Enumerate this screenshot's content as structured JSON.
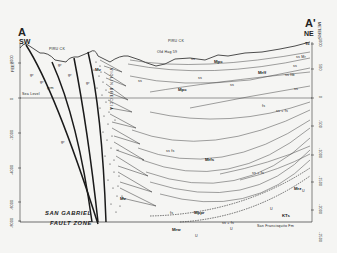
{
  "diagram": {
    "type": "geologic-cross-section",
    "endpoints": {
      "left": {
        "label": "A",
        "direction": "SW"
      },
      "right": {
        "label": "A'",
        "direction": "NE"
      }
    },
    "left_axis": {
      "unit": "FEET",
      "ticks": [
        "2000",
        "0",
        "-2000",
        "-4000",
        "-6000",
        "-8000"
      ]
    },
    "right_axis": {
      "unit": "METERS",
      "ticks": [
        "1000",
        "500",
        "0",
        "-500",
        "-1000",
        "-1500",
        "-2000",
        "-2500"
      ]
    },
    "sea_level_label": "Sea Level",
    "surface_labels": {
      "piru_ck_left": "PIRU CK",
      "piru_ck_right": "PIRU CK",
      "well": "Old Hag 59"
    },
    "units": {
      "gr_labels": [
        "gr",
        "gr",
        "gr",
        "gr",
        "gr",
        "gr",
        "grm"
      ],
      "violin_breccia": "VIOLIN BRECCIA",
      "mv_upper": "Mv",
      "mv_lower": "Mv",
      "mpc_left": "Mpc",
      "mpc_top": "Mpc",
      "mrff": "Mrff",
      "mrfs": "Mrfs",
      "mppr": "Mppr",
      "mrw": "Mrw",
      "mrz": "Mrz",
      "kts": "KTs",
      "tc": "Tc",
      "mr": "Mr",
      "ss_a": "ss",
      "ss_b": "ss",
      "ss_c": "ss",
      "ss_d": "ss",
      "fs_a": "fs",
      "fs_b": "fs",
      "ss_fs": "ss  fs",
      "ss_fs2": "ss  +  fs",
      "ss_fs3": "ss  +  fs",
      "ss_fs4": "ss  +  fs",
      "ss_mr": "ss Mr",
      "ss_ftb": "ss  ftb",
      "ss_e": "ss",
      "ss_f": "ss",
      "u1": "U",
      "u2": "U",
      "u3": "U",
      "u4": "U",
      "san_francisquito": "San Francisquito  Fm"
    },
    "fault_zone_label": {
      "line1": "SAN GABRIEL",
      "line2": "FAULT ZONE"
    },
    "colors": {
      "background": "#f5f5f3",
      "ink": "#1e1e1e",
      "thin_ink": "#555555"
    }
  }
}
